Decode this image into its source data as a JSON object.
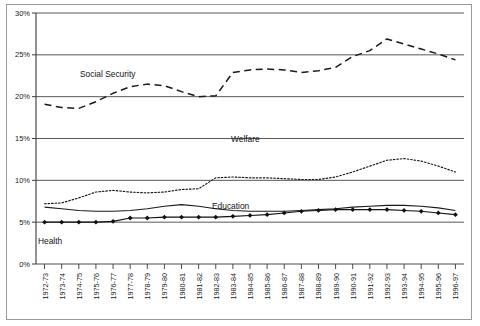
{
  "chart_data": {
    "type": "line",
    "title": "",
    "subtitle": "",
    "xlabel": "",
    "ylabel": "",
    "ylim": [
      0,
      30
    ],
    "ytick_labels": [
      "0%",
      "5%",
      "10%",
      "15%",
      "20%",
      "25%",
      "30%"
    ],
    "ytick_values": [
      0,
      5,
      10,
      15,
      20,
      25,
      30
    ],
    "grid": true,
    "legend_position": "inline-annotations",
    "categories": [
      "1972-73",
      "1973-74",
      "1974-75",
      "1975-76",
      "1976-77",
      "1977-78",
      "1978-79",
      "1979-80",
      "1980-81",
      "1981-82",
      "1982-83",
      "1983-84",
      "1984-85",
      "1985-86",
      "1986-87",
      "1987-88",
      "1988-89",
      "1989-90",
      "1990-91",
      "1991-92",
      "1992-93",
      "1993-94",
      "1994-95",
      "1995-96",
      "1996-97"
    ],
    "series": [
      {
        "name": "Social Security",
        "style": "long-dashed",
        "color": "#1a1a1a",
        "marker": "none",
        "values": [
          19.1,
          18.7,
          18.6,
          19.4,
          20.4,
          21.2,
          21.5,
          21.3,
          20.6,
          20.0,
          20.1,
          22.9,
          23.2,
          23.3,
          23.2,
          22.9,
          23.1,
          23.5,
          24.8,
          25.5,
          26.9,
          26.3,
          25.7,
          25.1,
          24.4
        ]
      },
      {
        "name": "Welfare",
        "style": "dotted",
        "color": "#1a1a1a",
        "marker": "none",
        "values": [
          7.2,
          7.3,
          7.9,
          8.6,
          8.8,
          8.6,
          8.5,
          8.6,
          8.9,
          9.0,
          10.3,
          10.4,
          10.3,
          10.3,
          10.2,
          10.1,
          10.1,
          10.4,
          11.0,
          11.7,
          12.4,
          12.6,
          12.3,
          11.7,
          11.0
        ]
      },
      {
        "name": "Education",
        "style": "solid",
        "color": "#1a1a1a",
        "marker": "none",
        "values": [
          6.8,
          6.6,
          6.4,
          6.3,
          6.3,
          6.4,
          6.6,
          6.9,
          7.1,
          6.9,
          6.6,
          6.4,
          6.3,
          6.3,
          6.3,
          6.4,
          6.5,
          6.6,
          6.8,
          6.9,
          7.0,
          7.0,
          6.9,
          6.7,
          6.4
        ]
      },
      {
        "name": "Health",
        "style": "solid-marker",
        "color": "#111111",
        "marker": "diamond",
        "values": [
          5.0,
          5.0,
          5.0,
          5.0,
          5.1,
          5.5,
          5.5,
          5.6,
          5.6,
          5.6,
          5.6,
          5.7,
          5.8,
          5.9,
          6.1,
          6.3,
          6.4,
          6.5,
          6.5,
          6.5,
          6.5,
          6.4,
          6.3,
          6.1,
          5.9
        ]
      }
    ],
    "annotations": [
      {
        "text": "Social Security",
        "x_px": 80,
        "y_px": 77
      },
      {
        "text": "Welfare",
        "x_px": 231,
        "y_px": 142
      },
      {
        "text": "Education",
        "x_px": 212,
        "y_px": 209
      },
      {
        "text": "Health",
        "x_px": 38,
        "y_px": 244
      }
    ]
  }
}
